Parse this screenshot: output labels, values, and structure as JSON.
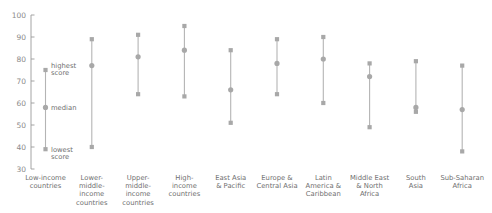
{
  "chart_data": {
    "type": "scatter",
    "title": "",
    "subtitle": "",
    "xlabel": "",
    "ylabel": "",
    "ylim": [
      30,
      100
    ],
    "yticks": [
      30,
      40,
      50,
      60,
      70,
      80,
      90,
      100
    ],
    "ytick_labels": [
      "30",
      "40",
      "50",
      "60",
      "70",
      "80",
      "90",
      "100"
    ],
    "grid": false,
    "legend": "none",
    "marker_color": "#a8a8a8",
    "line_color": "#b4b4b4",
    "axis_color": "#9a9a9a",
    "categories": [
      "Low-income countries",
      "Lower-middle-income countries",
      "Upper-middle-income countries",
      "High-income countries",
      "East Asia & Pacific",
      "Europe & Central Asia",
      "Latin America & Caribbean",
      "Middle East & North Africa",
      "South Asia",
      "Sub-Saharan Africa"
    ],
    "category_label_lines": [
      [
        "Low-income",
        "countries"
      ],
      [
        "Lower-",
        "middle-",
        "income",
        "countries"
      ],
      [
        "Upper-",
        "middle-",
        "income",
        "countries"
      ],
      [
        "High-",
        "income",
        "countries"
      ],
      [
        "East Asia",
        "& Pacific"
      ],
      [
        "Europe &",
        "Central Asia"
      ],
      [
        "Latin",
        "America &",
        "Caribbean"
      ],
      [
        "Middle East",
        "& North",
        "Africa"
      ],
      [
        "South",
        "Asia"
      ],
      [
        "Sub-Saharan",
        "Africa"
      ]
    ],
    "series": [
      {
        "name": "highest score",
        "values": [
          75,
          89,
          91,
          95,
          84,
          89,
          90,
          78,
          79,
          77
        ]
      },
      {
        "name": "median",
        "values": [
          58,
          77,
          81,
          84,
          66,
          78,
          80,
          72,
          58,
          57
        ]
      },
      {
        "name": "lowest score",
        "values": [
          39,
          40,
          64,
          63,
          51,
          64,
          60,
          49,
          56,
          38
        ]
      }
    ],
    "annotations": [
      {
        "text": "highest score",
        "series": "highest score",
        "category": "Low-income countries"
      },
      {
        "text": "median",
        "series": "median",
        "category": "Low-income countries"
      },
      {
        "text": "lowest score",
        "series": "lowest score",
        "category": "Low-income countries"
      }
    ],
    "annotation_labels": {
      "highest": [
        "highest",
        "score"
      ],
      "median": [
        "median"
      ],
      "lowest": [
        "lowest",
        "score"
      ]
    }
  }
}
